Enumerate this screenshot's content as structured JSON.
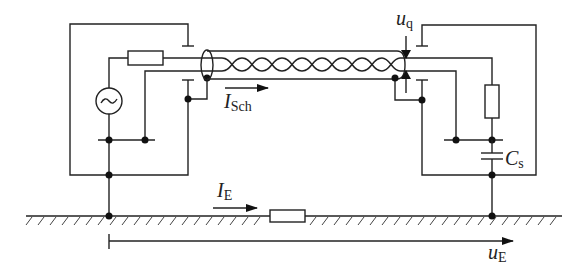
{
  "diagram": {
    "type": "circuit-schematic",
    "labels": {
      "u_q": {
        "main": "u",
        "sub": "q"
      },
      "I_Sch": {
        "main": "I",
        "sub": "Sch"
      },
      "C_s": {
        "main": "C",
        "sub": "s"
      },
      "I_E": {
        "main": "I",
        "sub": "E"
      },
      "u_E": {
        "main": "u",
        "sub": "E"
      }
    },
    "components": [
      {
        "id": "source",
        "kind": "ac-voltage-source",
        "symbol": "~"
      },
      {
        "id": "R_source",
        "kind": "resistor"
      },
      {
        "id": "cable",
        "kind": "shielded-twisted-pair"
      },
      {
        "id": "R_load",
        "kind": "resistor"
      },
      {
        "id": "C_s",
        "kind": "capacitor"
      },
      {
        "id": "R_ground",
        "kind": "resistor"
      },
      {
        "id": "ground",
        "kind": "earth-plane"
      }
    ],
    "colors": {
      "line": "#222222",
      "background": "#ffffff"
    }
  }
}
